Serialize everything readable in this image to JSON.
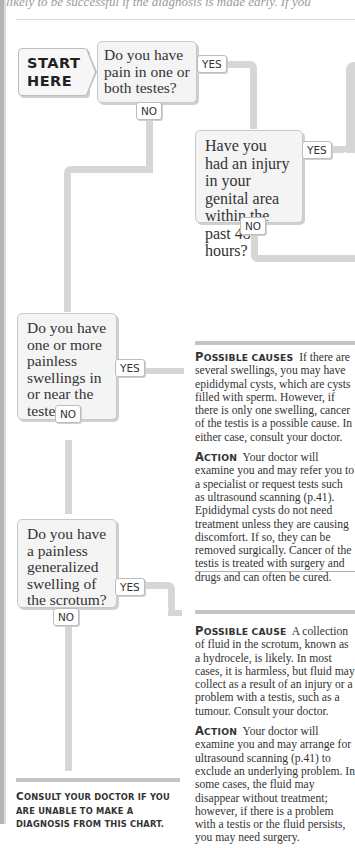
{
  "page": {
    "top_text": "likely to be successful if the diagnosis is made early. If you"
  },
  "start": {
    "line1": "START",
    "line2": "HERE"
  },
  "questions": [
    {
      "id": "q1",
      "text": "Do you have pain in one or both testes?",
      "yes_label": "YES",
      "no_label": "NO"
    },
    {
      "id": "q2",
      "text": "Have you had an injury in your genital area within the past 48 hours?",
      "yes_label": "YES",
      "no_label": "NO"
    },
    {
      "id": "q3",
      "text": "Do you have one or more painless swellings in or near the testes?",
      "yes_label": "YES",
      "no_label": "NO"
    },
    {
      "id": "q4",
      "text": "Do you have a painless generalized swelling of the scrotum?",
      "yes_label": "YES",
      "no_label": "NO"
    }
  ],
  "outcomes": [
    {
      "id": "swellings",
      "cause_heading_first": "P",
      "cause_heading_rest": "OSSIBLE CAUSES",
      "cause_text": "If there are several swellings, you may have epididymal cysts, which are cysts filled with sperm. However, if there is only one swelling, cancer of the testis is a possible cause. In either case, consult your doctor.",
      "action_heading_first": "A",
      "action_heading_rest": "CTION",
      "action_text": "Your doctor will examine you and may refer you to a specialist or request tests such as ultrasound scanning (p.41). Epididymal cysts do not need treatment unless they are causing discomfort. If so, they can be removed surgically. Cancer of the testis is treated with surgery and drugs and can often be cured."
    },
    {
      "id": "hydrocele",
      "cause_heading_first": "P",
      "cause_heading_rest": "OSSIBLE CAUSE",
      "cause_text": "A collection of fluid in the scrotum, known as a hydrocele, is likely. In most cases, it is harmless, but fluid may collect as a result of an injury or a problem with a testis, such as a tumour. Consult your doctor.",
      "action_heading_first": "A",
      "action_heading_rest": "CTION",
      "action_text": "Your doctor will examine you and may arrange for ultrasound scanning (p.41) to exclude an underlying problem. In some cases, the fluid may disappear without treatment; however, if there is a problem with a testis or the fluid persists, you may need surgery."
    }
  ],
  "footer": {
    "first": "C",
    "rest": "ONSULT YOUR DOCTOR IF YOU ARE UNABLE TO MAKE A DIAGNOSIS FROM THIS CHART."
  },
  "colors": {
    "pipe": "#d6d6d6",
    "box_bg": "#f4f4f4",
    "box_border": "#c8c8c8",
    "rule": "#c4c4c4"
  }
}
